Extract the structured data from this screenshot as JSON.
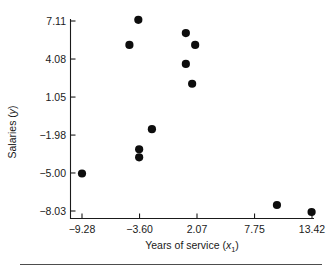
{
  "figure": {
    "name": "scatterplot-salaries-vs-years-of-service",
    "bottom_rule": true
  },
  "chart_data": {
    "type": "scatter",
    "title": "",
    "subtitle": "",
    "xlabel": "Years of service (x₁)",
    "xlabel_text": "Years of service",
    "xlabel_symbol": "x",
    "xlabel_subscript": "1",
    "ylabel": "Salaries (y)",
    "ylabel_text": "Salaries",
    "ylabel_symbol": "y",
    "grid": false,
    "legend": false,
    "legend_position": "none",
    "xticks": [
      -9.28,
      -3.6,
      2.07,
      7.75,
      13.42
    ],
    "xtick_labels": [
      "−9.28",
      "−3.60",
      "2.07",
      "7.75",
      "13.42"
    ],
    "yticks": [
      -8.03,
      -5.0,
      -1.98,
      1.05,
      4.08,
      7.11
    ],
    "ytick_labels": [
      "−8.03",
      "−5.00",
      "−1.98",
      "1.05",
      "4.08",
      "7.11"
    ],
    "xlim": [
      -10.5,
      13.6
    ],
    "ylim": [
      -8.7,
      7.7
    ],
    "marker": "filled-circle",
    "marker_color": "#0d0d0d",
    "marker_size": 4.1,
    "n_points": 12,
    "points": [
      {
        "x": -9.28,
        "y": -5.04
      },
      {
        "x": -4.6,
        "y": 5.2
      },
      {
        "x": -3.72,
        "y": 7.2
      },
      {
        "x": -3.64,
        "y": -3.11
      },
      {
        "x": -3.64,
        "y": -3.75
      },
      {
        "x": -2.38,
        "y": -1.51
      },
      {
        "x": 0.97,
        "y": 6.15
      },
      {
        "x": 0.97,
        "y": 3.69
      },
      {
        "x": 1.89,
        "y": 5.2
      },
      {
        "x": 1.59,
        "y": 2.11
      },
      {
        "x": 9.96,
        "y": -7.55
      },
      {
        "x": 13.38,
        "y": -8.11
      }
    ]
  }
}
